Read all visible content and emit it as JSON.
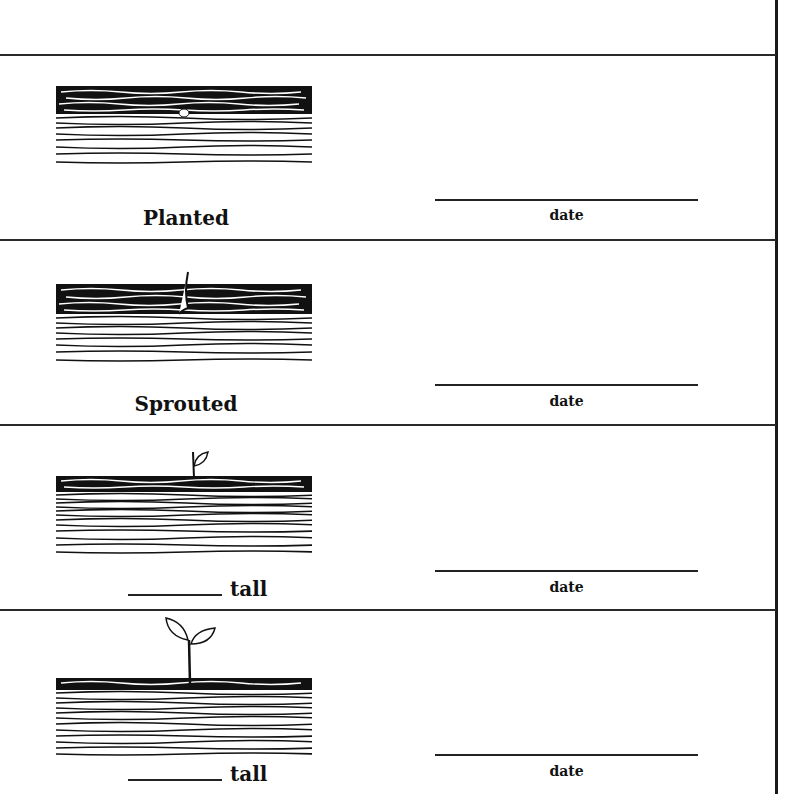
{
  "worksheet": {
    "stages": [
      {
        "label": "Planted",
        "has_blank": false,
        "date_label": "date",
        "illustration": "seed-in-soil"
      },
      {
        "label": "Sprouted",
        "has_blank": false,
        "date_label": "date",
        "illustration": "sprout-emerging"
      },
      {
        "label": "tall",
        "has_blank": true,
        "date_label": "date",
        "illustration": "seedling-one-leaf"
      },
      {
        "label": "tall",
        "has_blank": true,
        "date_label": "date",
        "illustration": "seedling-two-leaves"
      }
    ]
  }
}
